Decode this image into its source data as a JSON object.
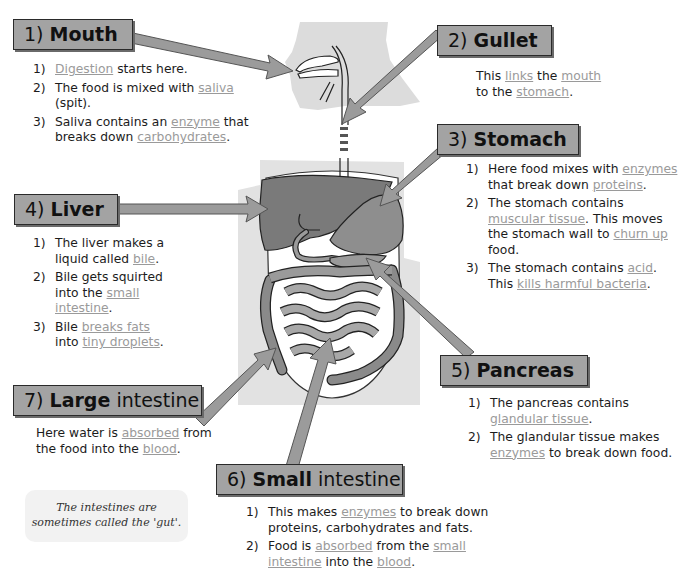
{
  "illustration": {
    "subject": "human digestive system",
    "colors": {
      "silhouette": "#dcdcdc",
      "organ_dark": "#7a7a7a",
      "organ_mid": "#8e8e8e",
      "intestine": "#9a9a9a",
      "arrow_fill": "#9b9b9b",
      "arrow_stroke": "#555555",
      "label_box": "#a3a3a3",
      "keyword": "#9a9a9a"
    }
  },
  "sections": {
    "mouth": {
      "number": "1)",
      "title": "Mouth",
      "items": [
        {
          "num": "1)",
          "parts": [
            {
              "kw": "Digestion"
            },
            {
              "t": " starts here."
            }
          ]
        },
        {
          "num": "2)",
          "parts": [
            {
              "t": "The food is mixed with "
            },
            {
              "kw": "saliva"
            },
            {
              "t": " (spit)."
            }
          ]
        },
        {
          "num": "3)",
          "parts": [
            {
              "t": "Saliva contains an "
            },
            {
              "kw": "enzyme"
            },
            {
              "t": " that breaks down "
            },
            {
              "kw": "carbohydrates"
            },
            {
              "t": "."
            }
          ]
        }
      ]
    },
    "gullet": {
      "number": "2)",
      "title": "Gullet",
      "text": [
        {
          "t": "This "
        },
        {
          "kw": "links"
        },
        {
          "t": " the "
        },
        {
          "kw": "mouth"
        },
        {
          "t": " to the "
        },
        {
          "kw": "stomach"
        },
        {
          "t": "."
        }
      ]
    },
    "stomach": {
      "number": "3)",
      "title": "Stomach",
      "items": [
        {
          "num": "1)",
          "parts": [
            {
              "t": "Here food mixes with "
            },
            {
              "kw": "enzymes"
            },
            {
              "t": " that break down "
            },
            {
              "kw": "proteins"
            },
            {
              "t": "."
            }
          ]
        },
        {
          "num": "2)",
          "parts": [
            {
              "t": "The stomach contains "
            },
            {
              "kw": "muscular tissue"
            },
            {
              "t": ". This moves the stomach wall to "
            },
            {
              "kw": "churn up"
            },
            {
              "t": " food."
            }
          ]
        },
        {
          "num": "3)",
          "parts": [
            {
              "t": "The stomach contains "
            },
            {
              "kw": "acid"
            },
            {
              "t": ". This "
            },
            {
              "kw": "kills harmful bacteria"
            },
            {
              "t": "."
            }
          ]
        }
      ]
    },
    "liver": {
      "number": "4)",
      "title": "Liver",
      "items": [
        {
          "num": "1)",
          "parts": [
            {
              "t": "The liver makes a liquid called "
            },
            {
              "kw": "bile"
            },
            {
              "t": "."
            }
          ]
        },
        {
          "num": "2)",
          "parts": [
            {
              "t": "Bile gets squirted into the "
            },
            {
              "kw": "small intestine"
            },
            {
              "t": "."
            }
          ]
        },
        {
          "num": "3)",
          "parts": [
            {
              "t": "Bile "
            },
            {
              "kw": "breaks fats"
            },
            {
              "t": " into "
            },
            {
              "kw": "tiny droplets"
            },
            {
              "t": "."
            }
          ]
        }
      ]
    },
    "pancreas": {
      "number": "5)",
      "title": "Pancreas",
      "items": [
        {
          "num": "1)",
          "parts": [
            {
              "t": "The pancreas contains "
            },
            {
              "kw": "glandular tissue"
            },
            {
              "t": "."
            }
          ]
        },
        {
          "num": "2)",
          "parts": [
            {
              "t": "The glandular tissue makes "
            },
            {
              "kw": "enzymes"
            },
            {
              "t": " to break down food."
            }
          ]
        }
      ]
    },
    "small_intestine": {
      "number": "6)",
      "title_bold": "Small",
      "title_light": "intestine",
      "items": [
        {
          "num": "1)",
          "parts": [
            {
              "t": "This makes "
            },
            {
              "kw": "enzymes"
            },
            {
              "t": " to break down proteins, carbohydrates and fats."
            }
          ]
        },
        {
          "num": "2)",
          "parts": [
            {
              "t": "Food is "
            },
            {
              "kw": "absorbed"
            },
            {
              "t": " from the "
            },
            {
              "kw": "small intestine"
            },
            {
              "t": " into the "
            },
            {
              "kw": "blood"
            },
            {
              "t": "."
            }
          ]
        }
      ]
    },
    "large_intestine": {
      "number": "7)",
      "title_bold": "Large",
      "title_light": "intestine",
      "text": [
        {
          "t": "Here water is "
        },
        {
          "kw": "absorbed"
        },
        {
          "t": " from the food into the "
        },
        {
          "kw": "blood"
        },
        {
          "t": "."
        }
      ]
    }
  },
  "tip": {
    "line1": "The intestines are",
    "line2": "sometimes called the 'gut'."
  }
}
